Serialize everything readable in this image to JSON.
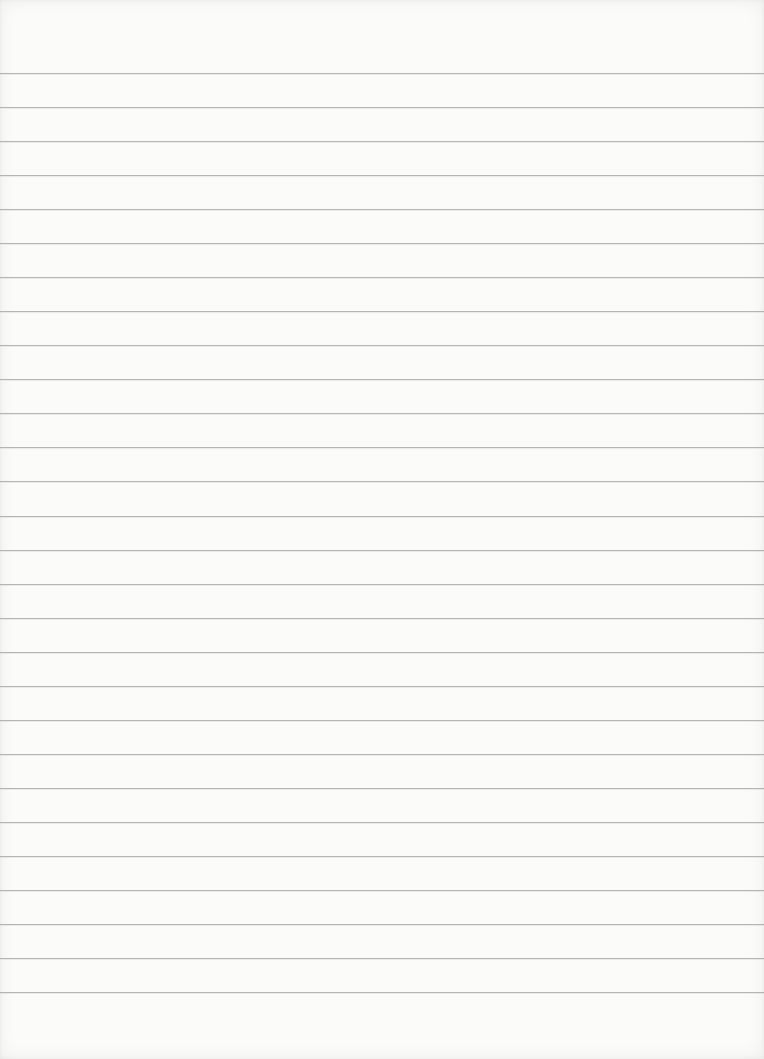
{
  "page": {
    "type": "lined-paper",
    "background_color": "#fbfbfa",
    "rule_color": "#a9a9a6",
    "rule_count": 28,
    "first_rule_y": 73,
    "rule_spacing_px": 34.04,
    "text_content": ""
  }
}
